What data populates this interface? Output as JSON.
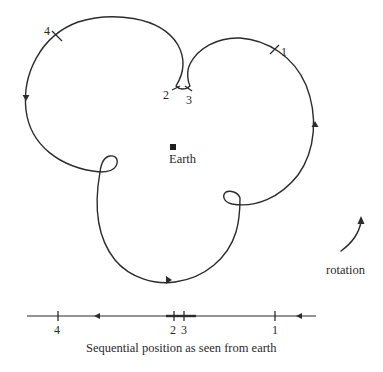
{
  "figure": {
    "earth_label": "Earth",
    "rotation_label": "rotation",
    "caption": "Sequential position as seen from earth",
    "orbit_markers": [
      {
        "id": "1",
        "label": "1"
      },
      {
        "id": "2",
        "label": "2"
      },
      {
        "id": "3",
        "label": "3"
      },
      {
        "id": "4",
        "label": "4"
      }
    ],
    "axis_markers": [
      {
        "label": "4"
      },
      {
        "label": "2"
      },
      {
        "label": "3"
      },
      {
        "label": "1"
      }
    ],
    "colors": {
      "stroke": "#2b2b2b",
      "background": "#ffffff"
    }
  }
}
